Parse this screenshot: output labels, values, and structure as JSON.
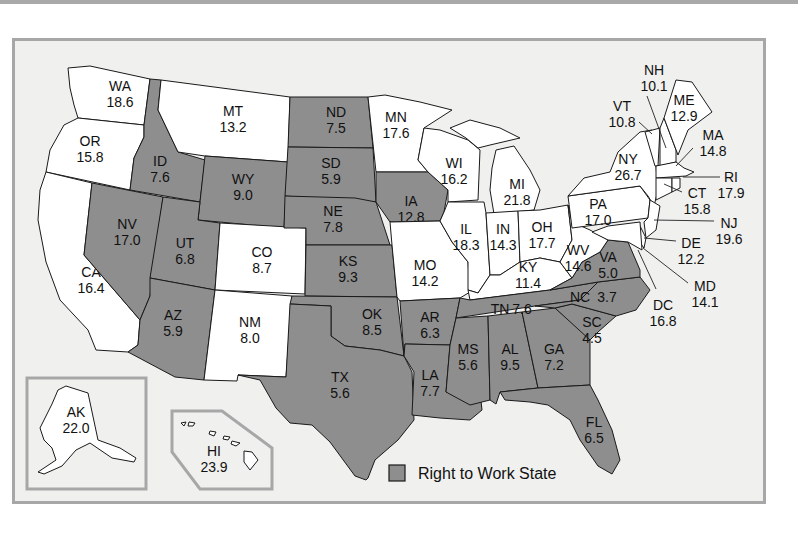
{
  "map": {
    "legend": {
      "label": "Right to Work State",
      "swatch_color": "#8e8e8e"
    },
    "colors": {
      "right_to_work": "#8e8e8e",
      "non_right_to_work": "#ffffff",
      "background": "#f0f0ef",
      "frame_border": "#a7a7a7"
    },
    "states": {
      "WA": {
        "abbr": "WA",
        "value": "18.6",
        "rtw": false
      },
      "OR": {
        "abbr": "OR",
        "value": "15.8",
        "rtw": false
      },
      "CA": {
        "abbr": "CA",
        "value": "16.4",
        "rtw": false
      },
      "ID": {
        "abbr": "ID",
        "value": "7.6",
        "rtw": true
      },
      "NV": {
        "abbr": "NV",
        "value": "17.0",
        "rtw": true
      },
      "MT": {
        "abbr": "MT",
        "value": "13.2",
        "rtw": false
      },
      "WY": {
        "abbr": "WY",
        "value": "9.0",
        "rtw": true
      },
      "UT": {
        "abbr": "UT",
        "value": "6.8",
        "rtw": true
      },
      "AZ": {
        "abbr": "AZ",
        "value": "5.9",
        "rtw": true
      },
      "CO": {
        "abbr": "CO",
        "value": "8.7",
        "rtw": false
      },
      "NM": {
        "abbr": "NM",
        "value": "8.0",
        "rtw": false
      },
      "ND": {
        "abbr": "ND",
        "value": "7.5",
        "rtw": true
      },
      "SD": {
        "abbr": "SD",
        "value": "5.9",
        "rtw": true
      },
      "NE": {
        "abbr": "NE",
        "value": "7.8",
        "rtw": true
      },
      "KS": {
        "abbr": "KS",
        "value": "9.3",
        "rtw": true
      },
      "OK": {
        "abbr": "OK",
        "value": "8.5",
        "rtw": true
      },
      "TX": {
        "abbr": "TX",
        "value": "5.6",
        "rtw": true
      },
      "MN": {
        "abbr": "MN",
        "value": "17.6",
        "rtw": false
      },
      "IA": {
        "abbr": "IA",
        "value": "12.8",
        "rtw": true
      },
      "MO": {
        "abbr": "MO",
        "value": "14.2",
        "rtw": false
      },
      "AR": {
        "abbr": "AR",
        "value": "6.3",
        "rtw": true
      },
      "LA": {
        "abbr": "LA",
        "value": "7.7",
        "rtw": true
      },
      "WI": {
        "abbr": "WI",
        "value": "16.2",
        "rtw": false
      },
      "IL": {
        "abbr": "IL",
        "value": "18.3",
        "rtw": false
      },
      "MI": {
        "abbr": "MI",
        "value": "21.8",
        "rtw": false
      },
      "IN": {
        "abbr": "IN",
        "value": "14.3",
        "rtw": false
      },
      "OH": {
        "abbr": "OH",
        "value": "17.7",
        "rtw": false
      },
      "KY": {
        "abbr": "KY",
        "value": "11.4",
        "rtw": false
      },
      "TN": {
        "abbr": "TN",
        "value": "7.6",
        "rtw": true
      },
      "MS": {
        "abbr": "MS",
        "value": "5.6",
        "rtw": true
      },
      "AL": {
        "abbr": "AL",
        "value": "9.5",
        "rtw": true
      },
      "GA": {
        "abbr": "GA",
        "value": "7.2",
        "rtw": true
      },
      "FL": {
        "abbr": "FL",
        "value": "6.5",
        "rtw": true
      },
      "SC": {
        "abbr": "SC",
        "value": "4.5",
        "rtw": true
      },
      "NC": {
        "abbr": "NC",
        "value": "3.7",
        "rtw": true
      },
      "VA": {
        "abbr": "VA",
        "value": "5.0",
        "rtw": true
      },
      "WV": {
        "abbr": "WV",
        "value": "14.6",
        "rtw": false
      },
      "PA": {
        "abbr": "PA",
        "value": "17.0",
        "rtw": false
      },
      "NY": {
        "abbr": "NY",
        "value": "26.7",
        "rtw": false
      },
      "VT": {
        "abbr": "VT",
        "value": "10.8",
        "rtw": false
      },
      "NH": {
        "abbr": "NH",
        "value": "10.1",
        "rtw": false
      },
      "ME": {
        "abbr": "ME",
        "value": "12.9",
        "rtw": false
      },
      "MA": {
        "abbr": "MA",
        "value": "14.8",
        "rtw": false
      },
      "RI": {
        "abbr": "RI",
        "value": "17.9",
        "rtw": false
      },
      "CT": {
        "abbr": "CT",
        "value": "15.8",
        "rtw": false
      },
      "NJ": {
        "abbr": "NJ",
        "value": "19.6",
        "rtw": false
      },
      "DE": {
        "abbr": "DE",
        "value": "12.2",
        "rtw": false
      },
      "MD": {
        "abbr": "MD",
        "value": "14.1",
        "rtw": false
      },
      "DC": {
        "abbr": "DC",
        "value": "16.8",
        "rtw": false
      },
      "AK": {
        "abbr": "AK",
        "value": "22.0",
        "rtw": false
      },
      "HI": {
        "abbr": "HI",
        "value": "23.9",
        "rtw": false
      }
    }
  }
}
